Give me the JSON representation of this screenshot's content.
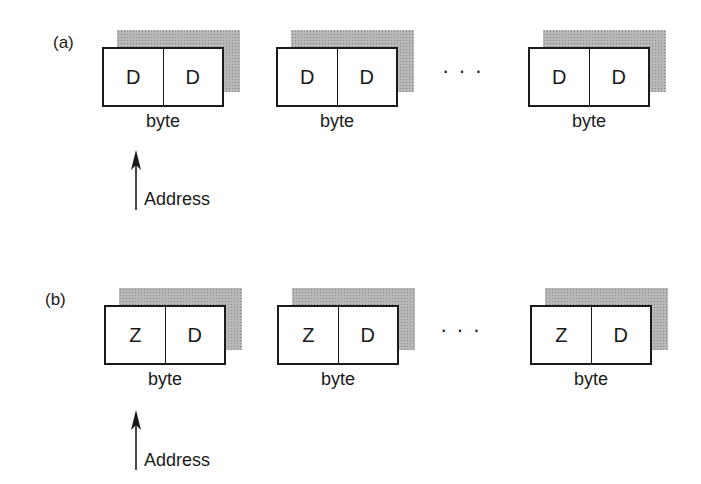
{
  "figure": {
    "panels": [
      {
        "tag": "(a)",
        "cells": [
          {
            "left": "D",
            "right": "D",
            "label": "byte"
          },
          {
            "left": "D",
            "right": "D",
            "label": "byte"
          },
          {
            "left": "D",
            "right": "D",
            "label": "byte"
          }
        ],
        "ellipsis": "...",
        "pointer_label": "Address"
      },
      {
        "tag": "(b)",
        "cells": [
          {
            "left": "Z",
            "right": "D",
            "label": "byte"
          },
          {
            "left": "Z",
            "right": "D",
            "label": "byte"
          },
          {
            "left": "Z",
            "right": "D",
            "label": "byte"
          }
        ],
        "ellipsis": "...",
        "pointer_label": "Address"
      }
    ]
  }
}
